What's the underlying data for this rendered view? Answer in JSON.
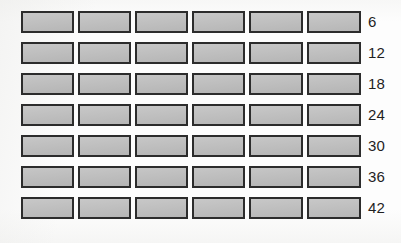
{
  "diagram": {
    "background_color": "#fdfdfd",
    "brick_fill_color": "#bcbcbc",
    "brick_border_color": "#2c2c2c",
    "label_color": "#1f1f1f",
    "columns": 6,
    "rows": 7,
    "geometry": {
      "grid_left": 21,
      "grid_top": 11,
      "brick_width": 53,
      "brick_height": 22,
      "column_gap": 4,
      "row_pitch": 31,
      "label_left": 368
    },
    "row_items": [
      {
        "index": 1,
        "label": "6",
        "bricks_in_row": 6,
        "cumulative_bricks": 6
      },
      {
        "index": 2,
        "label": "12",
        "bricks_in_row": 6,
        "cumulative_bricks": 12
      },
      {
        "index": 3,
        "label": "18",
        "bricks_in_row": 6,
        "cumulative_bricks": 18
      },
      {
        "index": 4,
        "label": "24",
        "bricks_in_row": 6,
        "cumulative_bricks": 24
      },
      {
        "index": 5,
        "label": "30",
        "bricks_in_row": 6,
        "cumulative_bricks": 30
      },
      {
        "index": 6,
        "label": "36",
        "bricks_in_row": 6,
        "cumulative_bricks": 36
      },
      {
        "index": 7,
        "label": "42",
        "bricks_in_row": 6,
        "cumulative_bricks": 42
      }
    ]
  }
}
